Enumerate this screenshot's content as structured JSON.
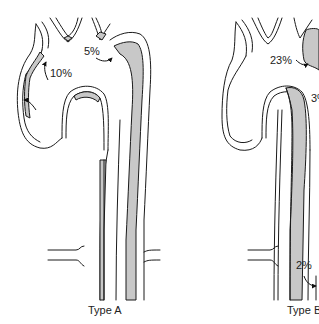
{
  "figure": {
    "panels": [
      {
        "id": "type-a",
        "caption": "Type A",
        "labels": [
          {
            "text": "10%"
          },
          {
            "text": "5%"
          }
        ]
      },
      {
        "id": "type-b",
        "caption": "Type B",
        "labels": [
          {
            "text": "23%"
          },
          {
            "text": "3%"
          },
          {
            "text": "2%"
          }
        ]
      }
    ],
    "colors": {
      "false_lumen_fill": "#c8c8c8",
      "outline": "#1a1a1a",
      "background": "#ffffff"
    }
  }
}
